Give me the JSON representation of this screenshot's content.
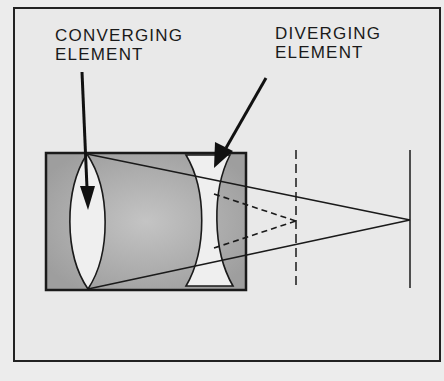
{
  "diagram": {
    "labels": {
      "converging": {
        "line1": "CONVERGING",
        "line2": "ELEMENT"
      },
      "diverging": {
        "line1": "DIVERGING",
        "line2": "ELEMENT"
      }
    },
    "colors": {
      "background": "#e9e9e9",
      "lens_housing": "#a9a9a9",
      "lens_glass": "#efefef",
      "stroke": "#1a1a1a"
    },
    "elements": [
      {
        "name": "converging-element",
        "type": "biconvex lens"
      },
      {
        "name": "diverging-element",
        "type": "biconcave lens"
      },
      {
        "name": "intermediate-focal-plane",
        "style": "dashed"
      },
      {
        "name": "final-focal-plane",
        "style": "solid"
      }
    ]
  }
}
